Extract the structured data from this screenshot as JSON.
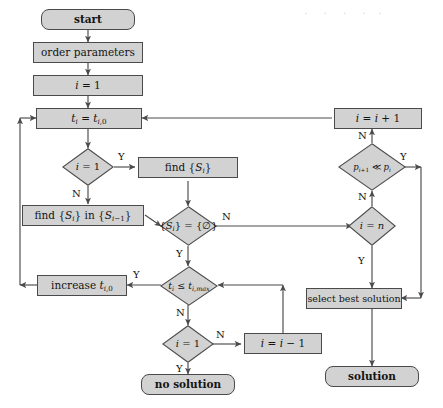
{
  "figure": {
    "type": "flowchart",
    "fill_color": "#d2d2d2",
    "stroke_color": "#4a4a4a",
    "text_color": "#141414",
    "background_color": "#ffffff"
  },
  "nodes": {
    "start": "start",
    "order_parameters": "order parameters",
    "i_init": "i = 1",
    "t_init": "tᵢ = tᵢ,₀",
    "decide_first_iteration": "i = 1",
    "find_set": "find {Sᵢ}",
    "find_set_in_prev": "find {Sᵢ} in {Sᵢ₋₁}",
    "decide_set_empty": "{Sᵢ} = {∅}",
    "decide_time_limit": "tᵢ ≤ tᵢ,ₘₐₓ",
    "increase_t": "increase tᵢ,₀",
    "decide_i_is_one": "i = 1",
    "decrement_i": "i = i − 1",
    "no_solution": "no solution",
    "increment_i": "i = i + 1",
    "decide_pressure": "pᵢ₊₁ ≪ pᵢ",
    "decide_i_is_n": "i = n",
    "select_best_solution": "select best solution",
    "solution": "solution"
  },
  "edge_labels": {
    "first_iteration_yes": "Y",
    "first_iteration_no": "N",
    "set_empty_no": "N",
    "set_empty_yes": "Y",
    "time_limit_yes": "Y",
    "time_limit_no": "N",
    "i_is_one_no": "N",
    "i_is_one_yes": "Y",
    "pressure_yes": "Y",
    "pressure_no_up": "N",
    "pressure_no_down": "N",
    "i_is_n_yes": "Y"
  },
  "background_bleed": [
    "the reverse side of the printed page",
    "faint show-through text",
    "is visible behind the figure",
    "as light grey smudges"
  ]
}
